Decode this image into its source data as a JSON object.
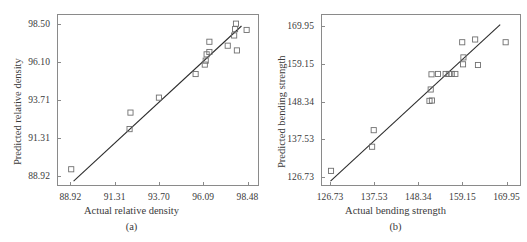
{
  "figure": {
    "background": "#ffffff",
    "axis_color": "#8a8a8a",
    "marker_color": "#6e6e6e",
    "line_color": "#2b2b2b"
  },
  "panels": [
    {
      "id": "a",
      "caption": "(a)",
      "xlabel": "Actual relative density",
      "ylabel": "Predicted  relative density",
      "xticks": [
        "88.92",
        "91.31",
        "93.70",
        "96.09",
        "98.48"
      ],
      "yticks": [
        "88.92",
        "91.31",
        "93.71",
        "96.10",
        "98.50"
      ]
    },
    {
      "id": "b",
      "caption": "(b)",
      "xlabel": "Actual bending strength",
      "ylabel": "Predicted  bending strength",
      "xticks": [
        "126.73",
        "137.53",
        "148.34",
        "159.15",
        "169.95"
      ],
      "yticks": [
        "126.73",
        "137.53",
        "148.34",
        "159.15",
        "169.95"
      ]
    }
  ],
  "chart_data": [
    {
      "type": "scatter",
      "id": "a",
      "title": "",
      "xlabel": "Actual relative density",
      "ylabel": "Predicted  relative density",
      "xlim": [
        88.2,
        99.1
      ],
      "ylim": [
        88.3,
        99.1
      ],
      "xticks": [
        88.92,
        91.31,
        93.7,
        96.09,
        98.48
      ],
      "yticks": [
        88.92,
        91.31,
        93.71,
        96.1,
        98.5
      ],
      "grid": false,
      "legend": null,
      "marker": "open-square",
      "points": [
        {
          "x": 88.92,
          "y": 89.3
        },
        {
          "x": 92.1,
          "y": 91.85
        },
        {
          "x": 92.15,
          "y": 92.9
        },
        {
          "x": 93.7,
          "y": 93.85
        },
        {
          "x": 95.7,
          "y": 95.35
        },
        {
          "x": 96.2,
          "y": 95.95
        },
        {
          "x": 96.25,
          "y": 96.2
        },
        {
          "x": 96.3,
          "y": 96.6
        },
        {
          "x": 96.45,
          "y": 96.75
        },
        {
          "x": 96.45,
          "y": 97.4
        },
        {
          "x": 97.45,
          "y": 97.15
        },
        {
          "x": 97.95,
          "y": 96.85
        },
        {
          "x": 97.8,
          "y": 97.8
        },
        {
          "x": 97.85,
          "y": 98.2
        },
        {
          "x": 97.9,
          "y": 98.55
        },
        {
          "x": 98.48,
          "y": 98.15
        }
      ],
      "fit_line": {
        "x": [
          89.05,
          98.2
        ],
        "y": [
          88.55,
          98.4
        ]
      }
    },
    {
      "type": "scatter",
      "id": "b",
      "title": "",
      "xlabel": "Actual bending strength",
      "ylabel": "Predicted  bending strength",
      "xlim": [
        124.5,
        173.5
      ],
      "ylim": [
        124.2,
        173.5
      ],
      "xticks": [
        126.73,
        137.53,
        148.34,
        159.15,
        169.95
      ],
      "yticks": [
        126.73,
        137.53,
        148.34,
        159.15,
        169.95
      ],
      "grid": false,
      "legend": null,
      "marker": "open-square",
      "points": [
        {
          "x": 126.73,
          "y": 128.3
        },
        {
          "x": 136.9,
          "y": 135.3
        },
        {
          "x": 137.3,
          "y": 140.1
        },
        {
          "x": 151.1,
          "y": 148.6
        },
        {
          "x": 151.7,
          "y": 148.7
        },
        {
          "x": 151.4,
          "y": 151.9
        },
        {
          "x": 151.6,
          "y": 156.3
        },
        {
          "x": 153.2,
          "y": 156.4
        },
        {
          "x": 155.1,
          "y": 156.4
        },
        {
          "x": 155.9,
          "y": 156.4
        },
        {
          "x": 156.6,
          "y": 156.4
        },
        {
          "x": 157.5,
          "y": 156.4
        },
        {
          "x": 159.4,
          "y": 159.2
        },
        {
          "x": 159.5,
          "y": 161.2
        },
        {
          "x": 159.2,
          "y": 165.6
        },
        {
          "x": 162.4,
          "y": 166.4
        },
        {
          "x": 163.1,
          "y": 159.0
        },
        {
          "x": 169.95,
          "y": 165.6
        }
      ],
      "fit_line": {
        "x": [
          126.6,
          168.6
        ],
        "y": [
          125.3,
          170.7
        ]
      }
    }
  ]
}
